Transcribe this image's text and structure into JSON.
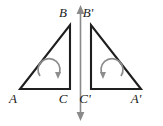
{
  "figure": {
    "background_color": "#ffffff",
    "stroke_color": "#1f1f1f",
    "mirror_color": "#8a8a8a",
    "arc_color": "#8d8d8d",
    "label_color": "#1b1b1b"
  },
  "mirror_line": {
    "name": "vertical-mirror-line",
    "x": 80.5,
    "y_top": 8,
    "y_bottom": 118,
    "has_arrow_top": true,
    "has_arrow_bottom": true,
    "color": "#8a8a8a",
    "stroke_width": 1.6
  },
  "triangles": [
    {
      "name": "triangle-abc",
      "orientation": "clockwise",
      "right_angle_at": "C",
      "points": "20,89 70,89 70,25",
      "vertices": [
        {
          "label": "A",
          "name": "vertex-label-a",
          "x": 20,
          "y": 89,
          "label_x": 13,
          "label_y": 103
        },
        {
          "label": "C",
          "name": "vertex-label-c",
          "x": 70,
          "y": 89,
          "label_x": 63,
          "label_y": 103
        },
        {
          "label": "B",
          "name": "vertex-label-b",
          "x": 70,
          "y": 25,
          "label_x": 63,
          "label_y": 17
        }
      ],
      "rotation_arc": {
        "name": "rotation-arc-left",
        "direction": "clockwise",
        "path": "M 40 76 A 11 11 0 1 1 58 76",
        "arrow_points": "55,72 61,72 58,79",
        "color": "#8d8d8d"
      }
    },
    {
      "name": "triangle-a-prime-b-prime-c-prime",
      "orientation": "counterclockwise",
      "right_angle_at": "C'",
      "points": "141,89 91,89 91,25",
      "vertices": [
        {
          "label": "B'",
          "name": "vertex-label-b-prime",
          "x": 91,
          "y": 25,
          "label_x": 88,
          "label_y": 17
        },
        {
          "label": "C'",
          "name": "vertex-label-c-prime",
          "x": 91,
          "y": 89,
          "label_x": 85,
          "label_y": 103
        },
        {
          "label": "A'",
          "name": "vertex-label-a-prime",
          "x": 141,
          "y": 89,
          "label_x": 136,
          "label_y": 103
        }
      ],
      "rotation_arc": {
        "name": "rotation-arc-right",
        "direction": "counterclockwise",
        "path": "M 121 76 A 11 11 0 1 0 103 76",
        "arrow_points": "100,72 106,72 103,79",
        "color": "#8d8d8d"
      }
    }
  ]
}
